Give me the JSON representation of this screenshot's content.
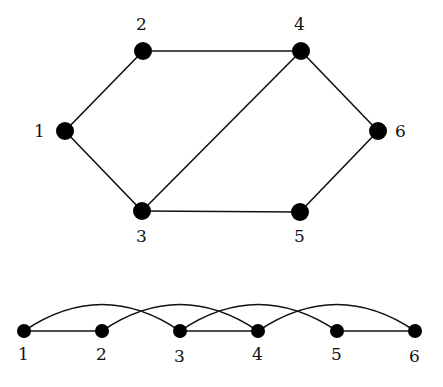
{
  "colors": {
    "edge": "#111111",
    "node": "#000000",
    "background": "#ffffff"
  },
  "top_graph": {
    "nodes": [
      {
        "id": "1",
        "label": "1",
        "x": 65,
        "y": 131
      },
      {
        "id": "2",
        "label": "2",
        "x": 143,
        "y": 51
      },
      {
        "id": "3",
        "label": "3",
        "x": 142,
        "y": 211
      },
      {
        "id": "4",
        "label": "4",
        "x": 301,
        "y": 51
      },
      {
        "id": "5",
        "label": "5",
        "x": 300,
        "y": 212
      },
      {
        "id": "6",
        "label": "6",
        "x": 378,
        "y": 131
      }
    ],
    "edges": [
      [
        "1",
        "2"
      ],
      [
        "1",
        "3"
      ],
      [
        "2",
        "4"
      ],
      [
        "3",
        "4"
      ],
      [
        "3",
        "5"
      ],
      [
        "4",
        "6"
      ],
      [
        "5",
        "6"
      ]
    ]
  },
  "linear_layout": {
    "nodes": [
      {
        "id": "1",
        "label": "1",
        "x": 24,
        "y": 331
      },
      {
        "id": "2",
        "label": "2",
        "x": 102,
        "y": 331
      },
      {
        "id": "3",
        "label": "3",
        "x": 180,
        "y": 331
      },
      {
        "id": "4",
        "label": "4",
        "x": 258,
        "y": 331
      },
      {
        "id": "5",
        "label": "5",
        "x": 337,
        "y": 331
      },
      {
        "id": "6",
        "label": "6",
        "x": 415,
        "y": 331
      }
    ],
    "straight_edges": [
      [
        "1",
        "2"
      ],
      [
        "3",
        "4"
      ],
      [
        "5",
        "6"
      ]
    ],
    "arc_edges": [
      [
        "1",
        "3"
      ],
      [
        "2",
        "4"
      ],
      [
        "3",
        "5"
      ],
      [
        "4",
        "6"
      ]
    ]
  }
}
